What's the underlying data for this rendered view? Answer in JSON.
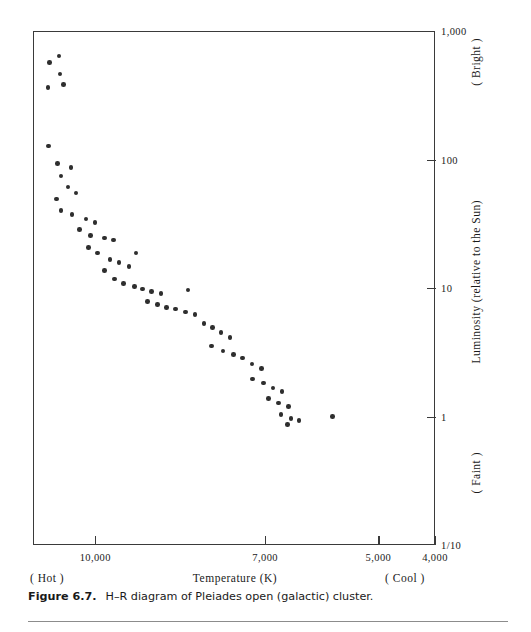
{
  "figure": {
    "caption_number": "Figure 6.7.",
    "caption_text": "H–R diagram of Pleiades open (galactic) cluster."
  },
  "annotations": {
    "hot": "( Hot )",
    "cool": "( Cool )",
    "bright": "( Bright )",
    "faint": "( Faint )"
  },
  "chart_data": {
    "type": "scatter",
    "title": "H–R diagram of Pleiades open (galactic) cluster",
    "xlabel": "Temperature (K)",
    "ylabel": "Luminosity (relative to the Sun)",
    "x_scale": "linear-reversed",
    "y_scale": "log",
    "xlim": [
      11100,
      4000
    ],
    "ylim": [
      0.1,
      1000
    ],
    "grid": false,
    "legend": null,
    "x_ticks": [
      {
        "value": 10000,
        "label": "10,000"
      },
      {
        "value": 7000,
        "label": "7,000"
      },
      {
        "value": 5000,
        "label": "5,000"
      },
      {
        "value": 4000,
        "label": "4,000"
      }
    ],
    "y_ticks": [
      {
        "value": 1000,
        "label": "1,000"
      },
      {
        "value": 100,
        "label": "100"
      },
      {
        "value": 10,
        "label": "10"
      },
      {
        "value": 1,
        "label": "1"
      },
      {
        "value": 0.1,
        "label": "1/10"
      }
    ],
    "point_count": 62,
    "points": [
      {
        "temperature": 10830,
        "luminosity": 580
      },
      {
        "temperature": 10660,
        "luminosity": 650
      },
      {
        "temperature": 10640,
        "luminosity": 470
      },
      {
        "temperature": 10580,
        "luminosity": 390
      },
      {
        "temperature": 10850,
        "luminosity": 370
      },
      {
        "temperature": 10840,
        "luminosity": 130
      },
      {
        "temperature": 10680,
        "luminosity": 95
      },
      {
        "temperature": 10450,
        "luminosity": 88
      },
      {
        "temperature": 10620,
        "luminosity": 76
      },
      {
        "temperature": 10500,
        "luminosity": 62
      },
      {
        "temperature": 10360,
        "luminosity": 56
      },
      {
        "temperature": 10700,
        "luminosity": 50
      },
      {
        "temperature": 10620,
        "luminosity": 41
      },
      {
        "temperature": 10430,
        "luminosity": 38
      },
      {
        "temperature": 10180,
        "luminosity": 35
      },
      {
        "temperature": 10020,
        "luminosity": 33
      },
      {
        "temperature": 10300,
        "luminosity": 29
      },
      {
        "temperature": 10100,
        "luminosity": 26
      },
      {
        "temperature": 9860,
        "luminosity": 25
      },
      {
        "temperature": 9700,
        "luminosity": 24
      },
      {
        "temperature": 10140,
        "luminosity": 21
      },
      {
        "temperature": 9980,
        "luminosity": 19
      },
      {
        "temperature": 9760,
        "luminosity": 17
      },
      {
        "temperature": 9600,
        "luminosity": 16
      },
      {
        "temperature": 9420,
        "luminosity": 15
      },
      {
        "temperature": 9860,
        "luminosity": 14
      },
      {
        "temperature": 9300,
        "luminosity": 19
      },
      {
        "temperature": 9680,
        "luminosity": 12
      },
      {
        "temperature": 9520,
        "luminosity": 11
      },
      {
        "temperature": 9330,
        "luminosity": 10.5
      },
      {
        "temperature": 9180,
        "luminosity": 10
      },
      {
        "temperature": 9020,
        "luminosity": 9.6
      },
      {
        "temperature": 8860,
        "luminosity": 9.2
      },
      {
        "temperature": 9100,
        "luminosity": 8.0
      },
      {
        "temperature": 8920,
        "luminosity": 7.6
      },
      {
        "temperature": 8760,
        "luminosity": 7.2
      },
      {
        "temperature": 8600,
        "luminosity": 7.0
      },
      {
        "temperature": 8420,
        "luminosity": 6.6
      },
      {
        "temperature": 8260,
        "luminosity": 6.3
      },
      {
        "temperature": 8380,
        "luminosity": 9.8
      },
      {
        "temperature": 8100,
        "luminosity": 5.4
      },
      {
        "temperature": 7950,
        "luminosity": 5.0
      },
      {
        "temperature": 7800,
        "luminosity": 4.6
      },
      {
        "temperature": 7640,
        "luminosity": 4.2
      },
      {
        "temperature": 7960,
        "luminosity": 3.6
      },
      {
        "temperature": 7760,
        "luminosity": 3.3
      },
      {
        "temperature": 7580,
        "luminosity": 3.1
      },
      {
        "temperature": 7420,
        "luminosity": 2.9
      },
      {
        "temperature": 7250,
        "luminosity": 2.6
      },
      {
        "temperature": 7080,
        "luminosity": 2.4
      },
      {
        "temperature": 7240,
        "luminosity": 2.0
      },
      {
        "temperature": 7050,
        "luminosity": 1.85
      },
      {
        "temperature": 6880,
        "luminosity": 1.7
      },
      {
        "temperature": 6720,
        "luminosity": 1.6
      },
      {
        "temperature": 6960,
        "luminosity": 1.4
      },
      {
        "temperature": 6780,
        "luminosity": 1.3
      },
      {
        "temperature": 6600,
        "luminosity": 1.22
      },
      {
        "temperature": 6740,
        "luminosity": 1.05
      },
      {
        "temperature": 6560,
        "luminosity": 0.98
      },
      {
        "temperature": 6420,
        "luminosity": 0.95
      },
      {
        "temperature": 6620,
        "luminosity": 0.88
      },
      {
        "temperature": 5830,
        "luminosity": 1.02
      }
    ]
  }
}
